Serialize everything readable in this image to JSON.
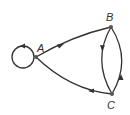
{
  "diagram": {
    "type": "directed-graph",
    "nodes": [
      {
        "id": "A",
        "label": "A"
      },
      {
        "id": "B",
        "label": "B"
      },
      {
        "id": "C",
        "label": "C"
      }
    ],
    "edges": [
      {
        "from": "A",
        "to": "A",
        "kind": "self-loop"
      },
      {
        "from": "A",
        "to": "B"
      },
      {
        "from": "B",
        "to": "C"
      },
      {
        "from": "C",
        "to": "B"
      },
      {
        "from": "C",
        "to": "A"
      }
    ],
    "colors": {
      "stroke": "#333333",
      "node": "#555555",
      "background": "#ffffff"
    }
  }
}
